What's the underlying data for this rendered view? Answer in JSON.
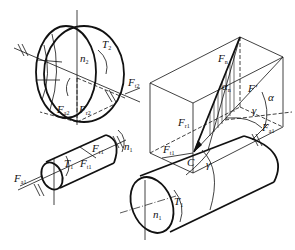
{
  "diagram": {
    "title": "",
    "labels": {
      "gear2_torque": "T",
      "gear2_torque_sub": "2",
      "gear2_speed": "n",
      "gear2_speed_sub": "2",
      "gear2_tangential": "F",
      "gear2_tangential_sub": "t2",
      "gear2_radial": "F",
      "gear2_radial_sub": "r2",
      "gear2_axial": "F",
      "gear2_axial_sub": "a2",
      "pinion_radial_small": "F",
      "pinion_radial_small_sub": "r1",
      "pinion_tangential_small": "F",
      "pinion_tangential_small_sub": "t1",
      "pinion_torque_small": "T",
      "pinion_torque_small_sub": "1",
      "pinion_speed_small": "n",
      "pinion_speed_small_sub": "1",
      "pinion_axial_small": "F",
      "pinion_axial_small_sub": "a1",
      "box_normal": "F",
      "box_normal_sub": "n",
      "box_fprime": "F′",
      "box_alpha_n": "α",
      "box_alpha_n_sub": "n",
      "box_alpha": "α",
      "box_gamma": "γ",
      "box_radial": "F",
      "box_radial_sub": "r1",
      "box_axial": "F",
      "box_axial_sub": "a1",
      "contact_tangential": "F",
      "contact_tangential_sub": "t1",
      "contact_point": "C",
      "contact_gamma": "γ",
      "shaft_torque": "T",
      "shaft_torque_sub": "1",
      "shaft_speed": "n",
      "shaft_speed_sub": "1"
    }
  }
}
